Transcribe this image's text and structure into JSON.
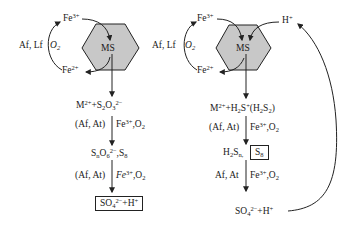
{
  "colors": {
    "hexagon_fill": "#c8c8c8",
    "stroke": "#222222",
    "text": "#1a1a1a"
  },
  "left_pathway": {
    "name": "thiosulfate pathway",
    "mineral": "MS",
    "iron_oxidized": "Fe",
    "iron_oxidized_charge": "3+",
    "iron_reduced": "Fe",
    "iron_reduced_charge": "2+",
    "organisms_iron": "Af, Lf",
    "oxidant": "O",
    "oxidant_sub": "2",
    "step1_product": {
      "M": "M",
      "M_charge": "2+",
      "plus": "+S",
      "s_sub": "2",
      "O": "O",
      "o_sub": "3",
      "charge": "2−"
    },
    "step1_organisms": "(Af, At)",
    "step1_oxidants": {
      "fe": "Fe",
      "fe_charge": "3+",
      "o2": ",O",
      "o2_sub": "2"
    },
    "step2_product": {
      "S": "S",
      "n": "n",
      "O": "O",
      "o_sub": "6",
      "charge": "2−",
      "tail": ",S",
      "tail_sub": "8"
    },
    "step2_organisms": "(Af, At)",
    "step2_oxidants": {
      "fe": "Fe",
      "fe_charge": "3+",
      "o2": ",O",
      "o2_sub": "2"
    },
    "final_product": {
      "SO": "SO",
      "sub": "4",
      "charge": "2−",
      "tail": "+H",
      "tail_charge": "+"
    }
  },
  "right_pathway": {
    "name": "polysulfide pathway",
    "mineral": "MS",
    "iron_oxidized": "Fe",
    "iron_oxidized_charge": "3+",
    "iron_reduced": "Fe",
    "iron_reduced_charge": "2+",
    "proton": "H",
    "proton_charge": "+",
    "organisms_iron": "Af, Lf",
    "oxidant": "O",
    "oxidant_sub": "2",
    "step1_product": {
      "M": "M",
      "M_charge": "2+",
      "plus": "+H",
      "h_sub": "2",
      "S": "S",
      "s_charge": "+",
      "paren": "(H",
      "paren_sub": "2",
      "paren_S": "S",
      "paren_S_sub": "2",
      "close": ")"
    },
    "step1_organisms": "(Af, At)",
    "step1_oxidants": {
      "fe": "Fe",
      "fe_charge": "3+",
      "o2": ",O",
      "o2_sub": "2"
    },
    "step2_product": {
      "H": "H",
      "h_sub": "2",
      "S": "S",
      "n": "n,",
      "boxed_S": "S",
      "boxed_sub": "8"
    },
    "step2_organisms": "Af, At",
    "step2_oxidants": {
      "fe": "Fe",
      "fe_charge": "3+",
      "o2": ",O",
      "o2_sub": "2"
    },
    "final_product": {
      "SO": "SO",
      "sub": "4",
      "charge": "2−",
      "tail": "+H",
      "tail_charge": "+"
    }
  }
}
